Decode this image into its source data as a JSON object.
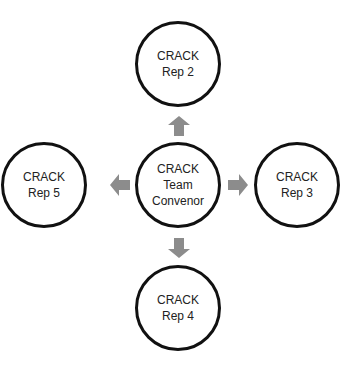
{
  "diagram": {
    "colors": {
      "circle_border": "#111111",
      "arrow": "#8c8c8c",
      "text": "#222222",
      "background": "#ffffff"
    },
    "center": {
      "id": "convenor",
      "lines": [
        "CRACK",
        "Team",
        "Convenor"
      ]
    },
    "nodes": [
      {
        "id": "rep2",
        "position": "top",
        "lines": [
          "CRACK",
          "Rep 2"
        ]
      },
      {
        "id": "rep3",
        "position": "right",
        "lines": [
          "CRACK",
          "Rep 3"
        ]
      },
      {
        "id": "rep4",
        "position": "bottom",
        "lines": [
          "CRACK",
          "Rep 4"
        ]
      },
      {
        "id": "rep5",
        "position": "left",
        "lines": [
          "CRACK",
          "Rep 5"
        ]
      }
    ],
    "arrows": [
      {
        "from": "convenor",
        "to": "rep2",
        "direction": "up"
      },
      {
        "from": "convenor",
        "to": "rep3",
        "direction": "right"
      },
      {
        "from": "convenor",
        "to": "rep4",
        "direction": "down"
      },
      {
        "from": "convenor",
        "to": "rep5",
        "direction": "left"
      }
    ]
  }
}
